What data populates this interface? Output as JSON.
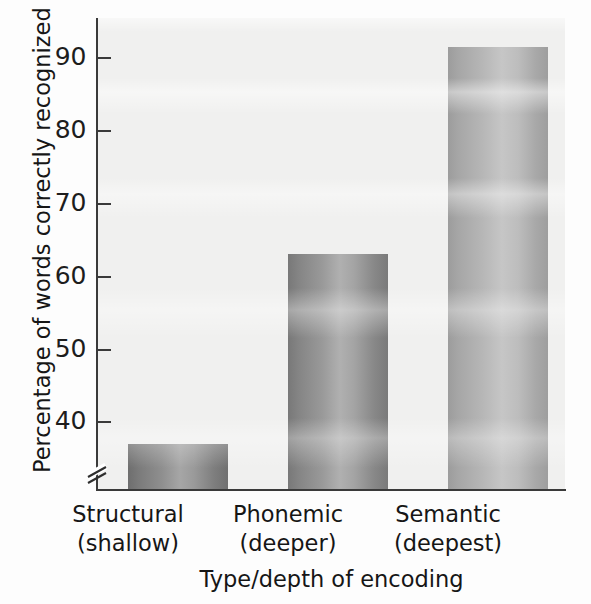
{
  "chart_data": {
    "type": "bar",
    "title": "",
    "subtitle": "",
    "xlabel": "Type/depth of encoding",
    "ylabel": "Percentage of words correctly recognized",
    "categories": [
      "Structural\n(shallow)",
      "Phonemic\n(deeper)",
      "Semantic\n(deepest)"
    ],
    "category_labels": [
      {
        "line1": "Structural",
        "line2": "(shallow)"
      },
      {
        "line1": "Phonemic",
        "line2": "(deeper)"
      },
      {
        "line1": "Semantic",
        "line2": "(deepest)"
      }
    ],
    "values": [
      41.5,
      64.5,
      89.5
    ],
    "ylim": [
      36,
      93
    ],
    "yticks": [
      40,
      50,
      60,
      70,
      80,
      90
    ],
    "ytick_labels": [
      "40",
      "50",
      "60",
      "70",
      "80",
      "90"
    ],
    "grid": false,
    "legend": null,
    "axis_break": true,
    "axis_break_axis": "y",
    "bar_colors": [
      "#8b8b8b",
      "#979797",
      "#b4b4b4"
    ]
  },
  "axes": {
    "y_title": "Percentage of words correctly recognized",
    "x_title": "Type/depth of encoding"
  },
  "ticks": {
    "y": [
      {
        "label": "90",
        "value": 90
      },
      {
        "label": "80",
        "value": 80
      },
      {
        "label": "70",
        "value": 70
      },
      {
        "label": "60",
        "value": 60
      },
      {
        "label": "50",
        "value": 50
      },
      {
        "label": "40",
        "value": 40
      }
    ]
  },
  "bars": [
    {
      "name": "structural",
      "label_line1": "Structural",
      "label_line2": "(shallow)",
      "value": 41.5
    },
    {
      "name": "phonemic",
      "label_line1": "Phonemic",
      "label_line2": "(deeper)",
      "value": 64.5
    },
    {
      "name": "semantic",
      "label_line1": "Semantic",
      "label_line2": "(deepest)",
      "value": 89.5
    }
  ]
}
